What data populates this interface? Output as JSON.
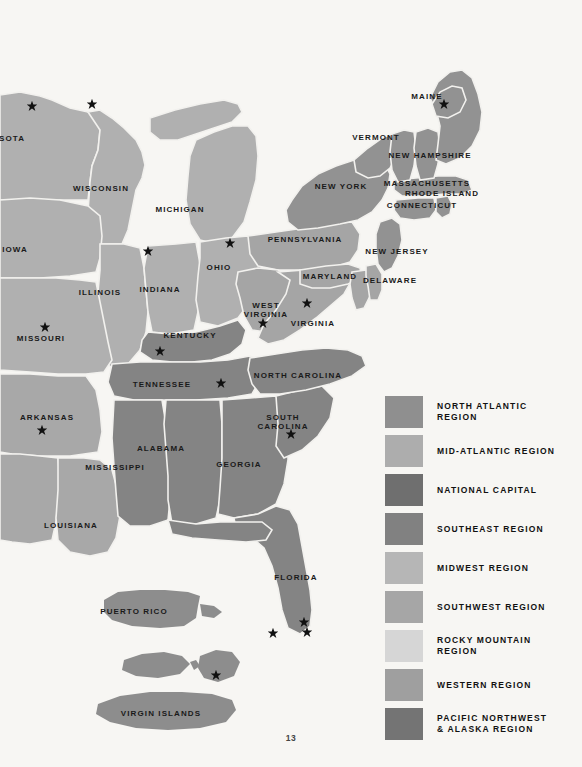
{
  "page": {
    "number": "13",
    "background_color": "#f7f6f3"
  },
  "map": {
    "title": "United States Regional Map",
    "colors": {
      "north_atlantic": "#8f8f8f",
      "mid_atlantic": "#a8a8a8",
      "national_capital": "#6e6e6e",
      "southeast": "#808080",
      "midwest": "#b0b0b0",
      "southwest": "#a0a0a0",
      "rocky_mountain": "#cfcfcf",
      "western": "#9b9b9b",
      "pacific_northwest": "#707070",
      "water": "#f7f6f3",
      "border": "#f2f1ee",
      "star": "#111111",
      "label": "#1a1a1a"
    },
    "state_labels": [
      {
        "text": "SOTA",
        "x": 12,
        "y": 139
      },
      {
        "text": "WISCONSIN",
        "x": 101,
        "y": 189
      },
      {
        "text": "MICHIGAN",
        "x": 180,
        "y": 210
      },
      {
        "text": "IOWA",
        "x": 15,
        "y": 250
      },
      {
        "text": "OHIO",
        "x": 219,
        "y": 268
      },
      {
        "text": "ILLINOIS",
        "x": 100,
        "y": 293
      },
      {
        "text": "INDIANA",
        "x": 160,
        "y": 290
      },
      {
        "text": "MISSOURI",
        "x": 41,
        "y": 339
      },
      {
        "text": "KENTUCKY",
        "x": 190,
        "y": 336
      },
      {
        "text": "ARKANSAS",
        "x": 47,
        "y": 418
      },
      {
        "text": "TENNESSEE",
        "x": 162,
        "y": 385
      },
      {
        "text": "MISSISSIPPI",
        "x": 115,
        "y": 468
      },
      {
        "text": "ALABAMA",
        "x": 161,
        "y": 449
      },
      {
        "text": "GEORGIA",
        "x": 239,
        "y": 465
      },
      {
        "text": "LOUISIANA",
        "x": 71,
        "y": 526
      },
      {
        "text": "FLORIDA",
        "x": 296,
        "y": 578
      },
      {
        "text": "NORTH CAROLINA",
        "x": 298,
        "y": 376
      },
      {
        "text": "SOUTH\nCAROLINA",
        "x": 283,
        "y": 422
      },
      {
        "text": "VIRGINIA",
        "x": 313,
        "y": 324
      },
      {
        "text": "WEST\nVIRGINIA",
        "x": 266,
        "y": 310
      },
      {
        "text": "MARYLAND",
        "x": 330,
        "y": 277
      },
      {
        "text": "DELAWARE",
        "x": 390,
        "y": 281
      },
      {
        "text": "NEW JERSEY",
        "x": 397,
        "y": 252
      },
      {
        "text": "PENNSYLVANIA",
        "x": 305,
        "y": 240
      },
      {
        "text": "NEW YORK",
        "x": 341,
        "y": 187
      },
      {
        "text": "VERMONT",
        "x": 376,
        "y": 138
      },
      {
        "text": "NEW HAMPSHIRE",
        "x": 430,
        "y": 156
      },
      {
        "text": "MASSACHUSETTS",
        "x": 427,
        "y": 184
      },
      {
        "text": "RHODE ISLAND",
        "x": 442,
        "y": 194
      },
      {
        "text": "CONNECTICUT",
        "x": 422,
        "y": 206
      },
      {
        "text": "MAINE",
        "x": 427,
        "y": 97
      },
      {
        "text": "PUERTO RICO",
        "x": 134,
        "y": 612
      },
      {
        "text": "VIRGIN ISLANDS",
        "x": 161,
        "y": 714
      }
    ],
    "stars": [
      {
        "x": 32,
        "y": 106,
        "name": "star-minnesota"
      },
      {
        "x": 92,
        "y": 104,
        "name": "star-upper-midwest"
      },
      {
        "x": 148,
        "y": 251,
        "name": "star-illinois-north"
      },
      {
        "x": 230,
        "y": 243,
        "name": "star-ohio"
      },
      {
        "x": 45,
        "y": 327,
        "name": "star-missouri"
      },
      {
        "x": 160,
        "y": 351,
        "name": "star-kentucky"
      },
      {
        "x": 42,
        "y": 430,
        "name": "star-arkansas"
      },
      {
        "x": 221,
        "y": 383,
        "name": "star-tennessee"
      },
      {
        "x": 263,
        "y": 323,
        "name": "star-west-virginia"
      },
      {
        "x": 307,
        "y": 303,
        "name": "star-national-capital"
      },
      {
        "x": 291,
        "y": 434,
        "name": "star-south-carolina"
      },
      {
        "x": 307,
        "y": 632,
        "name": "star-florida-south"
      },
      {
        "x": 304,
        "y": 622,
        "name": "star-florida-miami"
      },
      {
        "x": 273,
        "y": 633,
        "name": "star-florida-keys"
      },
      {
        "x": 444,
        "y": 104,
        "name": "star-maine"
      },
      {
        "x": 216,
        "y": 675,
        "name": "star-virgin-islands"
      }
    ]
  },
  "legend": {
    "items": [
      {
        "label": "NORTH ATLANTIC\nREGION",
        "color": "#8f8f8f",
        "name": "legend-north-atlantic"
      },
      {
        "label": "MID-ATLANTIC REGION",
        "color": "#adadad",
        "name": "legend-mid-atlantic"
      },
      {
        "label": "NATIONAL CAPITAL",
        "color": "#6f6f6f",
        "name": "legend-national-capital"
      },
      {
        "label": "SOUTHEAST REGION",
        "color": "#818181",
        "name": "legend-southeast"
      },
      {
        "label": "MIDWEST REGION",
        "color": "#b6b6b6",
        "name": "legend-midwest"
      },
      {
        "label": "SOUTHWEST REGION",
        "color": "#a6a6a6",
        "name": "legend-southwest"
      },
      {
        "label": "ROCKY MOUNTAIN\nREGION",
        "color": "#d6d6d6",
        "name": "legend-rocky-mountain"
      },
      {
        "label": "WESTERN REGION",
        "color": "#9f9f9f",
        "name": "legend-western"
      },
      {
        "label": "PACIFIC NORTHWEST\n& ALASKA REGION",
        "color": "#747474",
        "name": "legend-pacific-northwest"
      }
    ]
  }
}
